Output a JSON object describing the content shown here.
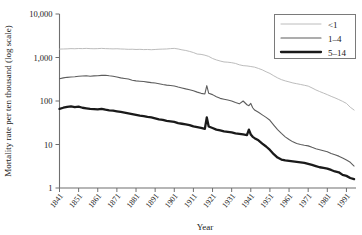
{
  "chart_data": {
    "type": "line",
    "title": "",
    "xlabel": "Year",
    "ylabel": "Mortality rate per ten thousand (log scale)",
    "yscale": "log",
    "ylim": [
      1,
      10000
    ],
    "xlim": [
      1841,
      1996
    ],
    "grid": false,
    "legend_position": "top-right",
    "ytick_labels": [
      "10,000",
      "1,000",
      "100",
      "10",
      "1"
    ],
    "ytick_values": [
      10000,
      1000,
      100,
      10,
      1
    ],
    "xtick_labels": [
      "1841",
      "1851",
      "1861",
      "1871",
      "1881",
      "1891",
      "1901",
      "1911",
      "1921",
      "1931",
      "1941",
      "1951",
      "1961",
      "1971",
      "1981",
      "1991"
    ],
    "xtick_values": [
      1841,
      1851,
      1861,
      1871,
      1881,
      1891,
      1901,
      1911,
      1921,
      1931,
      1941,
      1951,
      1961,
      1971,
      1981,
      1991
    ],
    "series": [
      {
        "name": "<1",
        "color": "#b4b4b4",
        "width": 0.9,
        "x": [
          1841,
          1843,
          1845,
          1847,
          1849,
          1851,
          1853,
          1855,
          1857,
          1859,
          1861,
          1863,
          1865,
          1867,
          1869,
          1871,
          1873,
          1875,
          1877,
          1879,
          1881,
          1883,
          1885,
          1887,
          1889,
          1891,
          1893,
          1895,
          1897,
          1899,
          1901,
          1903,
          1905,
          1907,
          1909,
          1911,
          1913,
          1915,
          1917,
          1919,
          1921,
          1923,
          1925,
          1927,
          1929,
          1931,
          1933,
          1935,
          1937,
          1939,
          1941,
          1943,
          1945,
          1947,
          1949,
          1951,
          1953,
          1955,
          1957,
          1959,
          1961,
          1963,
          1965,
          1967,
          1969,
          1971,
          1973,
          1975,
          1977,
          1979,
          1981,
          1983,
          1985,
          1987,
          1989,
          1991,
          1993,
          1995
        ],
        "values": [
          1560,
          1570,
          1580,
          1600,
          1590,
          1610,
          1600,
          1620,
          1600,
          1590,
          1600,
          1620,
          1600,
          1590,
          1580,
          1590,
          1570,
          1560,
          1540,
          1550,
          1530,
          1540,
          1520,
          1530,
          1510,
          1530,
          1550,
          1560,
          1570,
          1600,
          1620,
          1570,
          1500,
          1450,
          1380,
          1300,
          1200,
          1180,
          1130,
          1060,
          950,
          880,
          830,
          790,
          780,
          760,
          730,
          680,
          650,
          640,
          620,
          600,
          560,
          520,
          470,
          430,
          380,
          340,
          310,
          290,
          275,
          260,
          250,
          240,
          230,
          220,
          200,
          180,
          165,
          152,
          140,
          128,
          118,
          108,
          98,
          88,
          72,
          62
        ]
      },
      {
        "name": "1–4",
        "color": "#5d5d5d",
        "width": 1.1,
        "x": [
          1841,
          1843,
          1845,
          1847,
          1849,
          1851,
          1853,
          1855,
          1857,
          1859,
          1861,
          1863,
          1865,
          1867,
          1869,
          1871,
          1873,
          1875,
          1877,
          1879,
          1881,
          1883,
          1885,
          1887,
          1889,
          1891,
          1893,
          1895,
          1897,
          1899,
          1901,
          1903,
          1905,
          1907,
          1909,
          1911,
          1913,
          1915,
          1917,
          1918,
          1919,
          1921,
          1923,
          1925,
          1927,
          1929,
          1931,
          1933,
          1935,
          1937,
          1939,
          1940,
          1941,
          1942,
          1943,
          1945,
          1947,
          1949,
          1951,
          1953,
          1955,
          1957,
          1959,
          1961,
          1963,
          1965,
          1967,
          1969,
          1971,
          1973,
          1975,
          1977,
          1979,
          1981,
          1983,
          1985,
          1987,
          1989,
          1991,
          1993,
          1995
        ],
        "values": [
          325,
          340,
          350,
          355,
          360,
          370,
          375,
          380,
          372,
          378,
          380,
          388,
          392,
          380,
          370,
          355,
          340,
          330,
          320,
          300,
          290,
          285,
          280,
          272,
          265,
          260,
          250,
          240,
          232,
          228,
          222,
          210,
          200,
          190,
          182,
          172,
          160,
          150,
          145,
          225,
          150,
          140,
          125,
          115,
          110,
          105,
          100,
          92,
          86,
          100,
          82,
          78,
          88,
          70,
          62,
          55,
          48,
          42,
          36,
          28,
          22,
          18,
          15,
          13,
          11.5,
          10.5,
          10,
          9.6,
          9.3,
          8.6,
          8,
          7.6,
          7.2,
          6.8,
          6.2,
          5.8,
          5.4,
          4.9,
          4.4,
          3.9,
          3.2
        ]
      },
      {
        "name": "5–14",
        "color": "#1a1a1a",
        "width": 2.3,
        "x": [
          1841,
          1843,
          1845,
          1847,
          1849,
          1851,
          1853,
          1855,
          1857,
          1859,
          1861,
          1863,
          1865,
          1867,
          1869,
          1871,
          1873,
          1875,
          1877,
          1879,
          1881,
          1883,
          1885,
          1887,
          1889,
          1891,
          1893,
          1895,
          1897,
          1899,
          1901,
          1903,
          1905,
          1907,
          1909,
          1911,
          1913,
          1915,
          1917,
          1918,
          1919,
          1921,
          1923,
          1925,
          1927,
          1929,
          1931,
          1933,
          1935,
          1937,
          1939,
          1940,
          1941,
          1942,
          1943,
          1945,
          1947,
          1949,
          1951,
          1953,
          1955,
          1957,
          1959,
          1961,
          1963,
          1965,
          1967,
          1969,
          1971,
          1973,
          1975,
          1977,
          1979,
          1981,
          1983,
          1985,
          1987,
          1989,
          1991,
          1993,
          1995
        ],
        "values": [
          66,
          70,
          73,
          75,
          72,
          74,
          70,
          68,
          66,
          65,
          64,
          66,
          63,
          61,
          60,
          58,
          56,
          54,
          52,
          50,
          48,
          46,
          45,
          43,
          42,
          40,
          38,
          37,
          35,
          34,
          33,
          31,
          30,
          29,
          28,
          26,
          25,
          24,
          23,
          42,
          26,
          24,
          22,
          21,
          20,
          19.5,
          19,
          18,
          17.5,
          17,
          16.5,
          22,
          17,
          15,
          14,
          12.5,
          10.5,
          9,
          7.5,
          6,
          5,
          4.5,
          4.3,
          4.2,
          4.1,
          4.0,
          3.9,
          3.8,
          3.6,
          3.4,
          3.2,
          3.0,
          2.9,
          2.8,
          2.6,
          2.4,
          2.3,
          2.0,
          1.9,
          1.7,
          1.6
        ]
      }
    ]
  },
  "legend": {
    "items": [
      {
        "label": "<1"
      },
      {
        "label": "1–4"
      },
      {
        "label": "5–14"
      }
    ]
  }
}
